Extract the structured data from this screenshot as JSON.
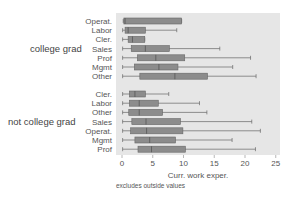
{
  "chart_data": {
    "type": "boxplot",
    "title": "",
    "xlabel": "Curr. work exper.",
    "ylabel": "",
    "note": "excludes outside values",
    "xlim": [
      0,
      25
    ],
    "xticks": [
      0,
      5,
      10,
      15,
      20,
      25
    ],
    "orientation": "horizontal",
    "groups": [
      {
        "name": "college grad",
        "categories": [
          {
            "label": "Operat.",
            "min": 0.2,
            "q1": 0.3,
            "median": 0.5,
            "q3": 9.7,
            "max": 9.7
          },
          {
            "label": "Labor",
            "min": 0.1,
            "q1": 0.5,
            "median": 1.0,
            "q3": 3.8,
            "max": 8.9
          },
          {
            "label": "Cler.",
            "min": 0.1,
            "q1": 1.0,
            "median": 1.7,
            "q3": 3.7,
            "max": 3.7
          },
          {
            "label": "Sales",
            "min": 0.1,
            "q1": 1.5,
            "median": 3.8,
            "q3": 7.7,
            "max": 15.9
          },
          {
            "label": "Prof",
            "min": 0.1,
            "q1": 2.5,
            "median": 5.5,
            "q3": 10.2,
            "max": 20.9
          },
          {
            "label": "Mgmt",
            "min": 0.1,
            "q1": 2.0,
            "median": 6.0,
            "q3": 9.1,
            "max": 18.0
          },
          {
            "label": "Other",
            "min": 0.1,
            "q1": 2.9,
            "median": 8.6,
            "q3": 13.9,
            "max": 21.8
          }
        ]
      },
      {
        "name": "not college grad",
        "categories": [
          {
            "label": "Cler.",
            "min": 0.1,
            "q1": 1.2,
            "median": 2.1,
            "q3": 3.8,
            "max": 7.6
          },
          {
            "label": "Labor",
            "min": 0.1,
            "q1": 1.2,
            "median": 2.8,
            "q3": 5.9,
            "max": 12.6
          },
          {
            "label": "Other",
            "min": 0.1,
            "q1": 1.1,
            "median": 2.8,
            "q3": 6.6,
            "max": 13.8
          },
          {
            "label": "Sales",
            "min": 0.1,
            "q1": 1.6,
            "median": 3.9,
            "q3": 9.5,
            "max": 21.1
          },
          {
            "label": "Operat.",
            "min": 0.1,
            "q1": 1.4,
            "median": 4.0,
            "q3": 9.9,
            "max": 22.5
          },
          {
            "label": "Mgmt",
            "min": 0.1,
            "q1": 2.1,
            "median": 4.5,
            "q3": 8.7,
            "max": 17.9
          },
          {
            "label": "Prof",
            "min": 0.1,
            "q1": 2.6,
            "median": 4.8,
            "q3": 10.3,
            "max": 21.7
          }
        ]
      }
    ],
    "colors": {
      "plot_bg": "#e6e6e6",
      "box_fill": "#8c8c8c",
      "box_stroke": "#666666",
      "whisker": "#666666"
    }
  }
}
